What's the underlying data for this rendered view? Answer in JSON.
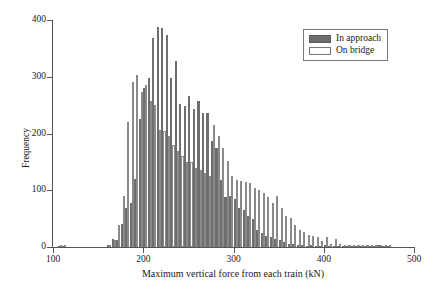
{
  "chart_data": {
    "type": "bar",
    "subtype": "histogram-grouped",
    "title": "",
    "xlabel": "Maximum vertical force from each train (kN)",
    "ylabel": "Frequency",
    "xlim": [
      100,
      500
    ],
    "ylim": [
      0,
      400
    ],
    "xticks": [
      100,
      200,
      300,
      400,
      500
    ],
    "yticks": [
      0,
      100,
      200,
      300,
      400
    ],
    "grid": false,
    "legend_position": "top-right",
    "bin_width": 5,
    "bin_centers": [
      102.5,
      107.5,
      112.5,
      117.5,
      122.5,
      127.5,
      132.5,
      137.5,
      142.5,
      147.5,
      152.5,
      157.5,
      162.5,
      167.5,
      172.5,
      177.5,
      182.5,
      187.5,
      192.5,
      197.5,
      202.5,
      207.5,
      212.5,
      217.5,
      222.5,
      227.5,
      232.5,
      237.5,
      242.5,
      247.5,
      252.5,
      257.5,
      262.5,
      267.5,
      272.5,
      277.5,
      282.5,
      287.5,
      292.5,
      297.5,
      302.5,
      307.5,
      312.5,
      317.5,
      322.5,
      327.5,
      332.5,
      337.5,
      342.5,
      347.5,
      352.5,
      357.5,
      362.5,
      367.5,
      372.5,
      377.5,
      382.5,
      387.5,
      392.5,
      397.5,
      402.5,
      407.5,
      412.5,
      417.5,
      422.5,
      427.5,
      432.5,
      437.5,
      442.5,
      447.5,
      452.5,
      457.5,
      462.5,
      467.5,
      472.5
    ],
    "series": [
      {
        "name": "In approach",
        "color": "#6e6e6e",
        "values": [
          0,
          1,
          2,
          0,
          0,
          0,
          0,
          0,
          0,
          0,
          0,
          0,
          4,
          14,
          12,
          40,
          68,
          78,
          120,
          225,
          280,
          297,
          369,
          388,
          386,
          373,
          298,
          328,
          252,
          249,
          266,
          244,
          257,
          236,
          237,
          187,
          175,
          118,
          88,
          90,
          85,
          68,
          65,
          55,
          50,
          30,
          24,
          20,
          18,
          14,
          12,
          8,
          6,
          5,
          3,
          3,
          2,
          3,
          2,
          1,
          4,
          1,
          1,
          2,
          1,
          1,
          1,
          1,
          1,
          1,
          1,
          1,
          4,
          1,
          1
        ]
      },
      {
        "name": "On bridge",
        "color": "#ffffff",
        "values": [
          0,
          1,
          2,
          0,
          0,
          0,
          0,
          0,
          0,
          0,
          0,
          0,
          3,
          12,
          38,
          90,
          220,
          290,
          303,
          273,
          285,
          258,
          250,
          206,
          205,
          195,
          180,
          170,
          160,
          150,
          150,
          140,
          135,
          130,
          125,
          215,
          195,
          175,
          152,
          125,
          118,
          116,
          115,
          113,
          104,
          100,
          96,
          88,
          78,
          90,
          68,
          55,
          52,
          38,
          30,
          26,
          22,
          20,
          18,
          10,
          18,
          6,
          14,
          5,
          4,
          2,
          2,
          2,
          2,
          1,
          1,
          1,
          2,
          1,
          1
        ]
      }
    ]
  },
  "legend": {
    "items": [
      {
        "label": "In approach",
        "swatch": "filled-dark"
      },
      {
        "label": "On bridge",
        "swatch": "outlined-white"
      }
    ]
  },
  "axes": {
    "y_title": "Frequency",
    "x_title": "Maximum vertical force from each train (kN)",
    "y_tick_labels": [
      "0",
      "100",
      "200",
      "300",
      "400"
    ],
    "x_tick_labels": [
      "100",
      "200",
      "300",
      "400",
      "500"
    ]
  },
  "colors": {
    "approach_fill": "#6e6e6e",
    "bridge_fill": "#ffffff",
    "bridge_stroke": "#8a8a8a",
    "axis": "#555555",
    "text": "#1a1a1a"
  }
}
